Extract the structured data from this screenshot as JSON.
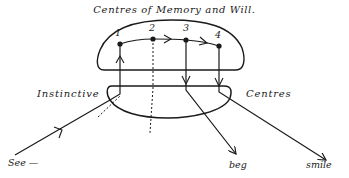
{
  "diagram": {
    "title": "Centres of Memory and Will.",
    "regions": {
      "upper": "Centres of Memory and Will",
      "lower_left_label": "Instinctive",
      "lower_right_label": "Centres"
    },
    "nodes": [
      {
        "label": "1"
      },
      {
        "label": "2"
      },
      {
        "label": "3"
      },
      {
        "label": "4"
      }
    ],
    "inputs": [
      {
        "label": "See —"
      }
    ],
    "outputs": [
      {
        "label": "beg"
      },
      {
        "label": "smile"
      }
    ],
    "colors": {
      "ink": "#1a1a1a",
      "background": "#ffffff"
    }
  }
}
